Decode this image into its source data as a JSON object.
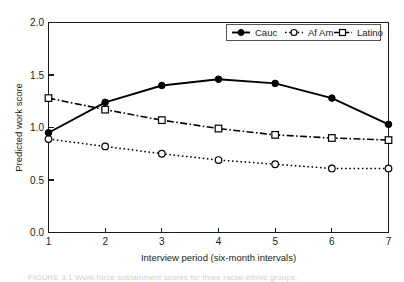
{
  "chart_data": {
    "type": "line",
    "title": "",
    "xlabel": "Interview period (six-month intervals)",
    "ylabel": "Predicted work score",
    "x": [
      1,
      2,
      3,
      4,
      5,
      6,
      7
    ],
    "xticklabels": [
      "1",
      "2",
      "3",
      "4",
      "5",
      "6",
      "7"
    ],
    "yticklabels": [
      "0.0",
      "0.5",
      "1.0",
      "1.5",
      "2.0"
    ],
    "yticks": [
      0.0,
      0.5,
      1.0,
      1.5,
      2.0
    ],
    "xlim": [
      1,
      7
    ],
    "ylim": [
      0.0,
      2.0
    ],
    "grid": false,
    "legend_position": "top-right",
    "series": [
      {
        "name": "Cauc",
        "marker": "filled-circle",
        "linestyle": "solid",
        "values": [
          0.95,
          1.24,
          1.4,
          1.46,
          1.42,
          1.28,
          1.03
        ]
      },
      {
        "name": "Af Am",
        "marker": "open-circle",
        "linestyle": "dotted",
        "values": [
          0.89,
          0.82,
          0.75,
          0.69,
          0.65,
          0.61,
          0.61
        ]
      },
      {
        "name": "Latino",
        "marker": "open-square",
        "linestyle": "dash-dot",
        "values": [
          1.28,
          1.17,
          1.07,
          0.99,
          0.93,
          0.9,
          0.88
        ]
      }
    ]
  },
  "axes": {
    "y_label": "Predicted work score",
    "x_label": "Interview period (six-month intervals)",
    "y_tick_0": "0.0",
    "y_tick_1": "0.5",
    "y_tick_2": "1.0",
    "y_tick_3": "1.5",
    "y_tick_4": "2.0",
    "x_tick_0": "1",
    "x_tick_1": "2",
    "x_tick_2": "3",
    "x_tick_3": "4",
    "x_tick_4": "5",
    "x_tick_5": "6",
    "x_tick_6": "7"
  },
  "legend": {
    "entries": [
      {
        "label": "Cauc"
      },
      {
        "label": "Af Am"
      },
      {
        "label": "Latino"
      }
    ]
  },
  "caption": {
    "text": "FIGURE 3.1  Work-force sustainment scores for three racial-ethnic groups."
  },
  "colors": {
    "line": "#000000",
    "axis": "#1a1a1a",
    "background": "#ffffff",
    "legend_border": "#555555"
  }
}
